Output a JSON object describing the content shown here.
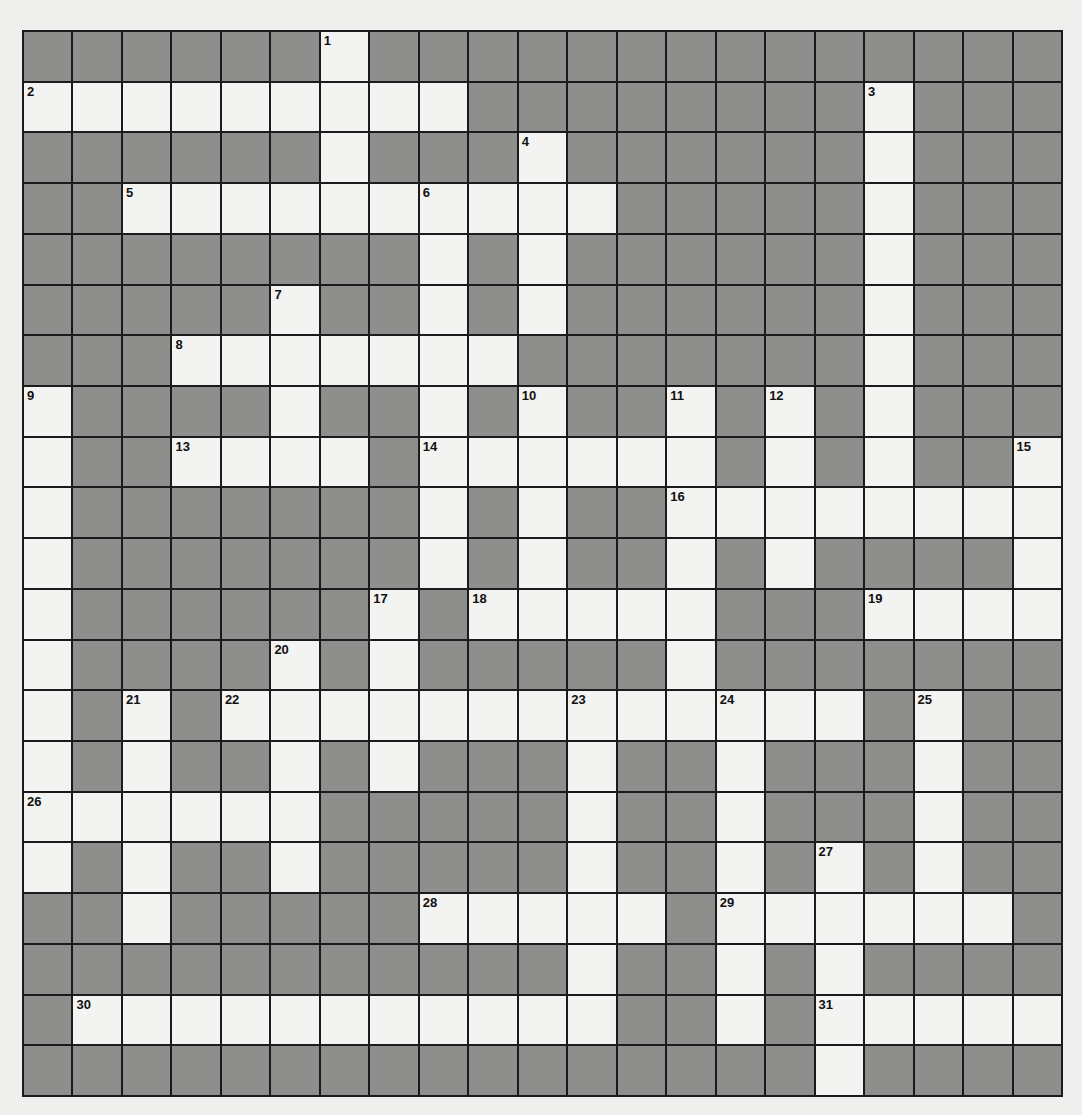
{
  "puzzle": {
    "rows": 21,
    "cols": 21,
    "colors": {
      "white_cell": "#f3f3f1",
      "block_cell": "#8e8e8c",
      "grid_line": "#1b1b1b",
      "page": "#efefed"
    },
    "layout": [
      "######.##############",
      ".........########.###",
      "######.###.######.###",
      "##..........#####.###",
      "########.#.######.###",
      "#####.##.#.######.###",
      "###.......#######.###",
      ".####.##.#.##.#.#.###",
      ".##....#......#.#.##.",
      ".#######.#.##........",
      ".#######.#.##.#.####.",
      ".######.#.....###....",
      ".####.#.#####.#######",
      ".#.#.............#.##",
      ".#.##.#.###.##.###.##",
      "......#####.##.###.##",
      ".#.##.#####.##.#.#.##",
      "##.#####.....#......#",
      "###########.##.#.####",
      "#...........##.#.....",
      "################.####"
    ],
    "numbers": [
      {
        "n": "1",
        "r": 0,
        "c": 6
      },
      {
        "n": "2",
        "r": 1,
        "c": 0
      },
      {
        "n": "3",
        "r": 1,
        "c": 17
      },
      {
        "n": "4",
        "r": 2,
        "c": 10
      },
      {
        "n": "5",
        "r": 3,
        "c": 2
      },
      {
        "n": "6",
        "r": 3,
        "c": 8
      },
      {
        "n": "7",
        "r": 5,
        "c": 5
      },
      {
        "n": "8",
        "r": 6,
        "c": 3
      },
      {
        "n": "9",
        "r": 7,
        "c": 0
      },
      {
        "n": "10",
        "r": 7,
        "c": 10
      },
      {
        "n": "11",
        "r": 7,
        "c": 13
      },
      {
        "n": "12",
        "r": 7,
        "c": 15
      },
      {
        "n": "13",
        "r": 8,
        "c": 3
      },
      {
        "n": "14",
        "r": 8,
        "c": 8
      },
      {
        "n": "15",
        "r": 8,
        "c": 20
      },
      {
        "n": "16",
        "r": 9,
        "c": 13
      },
      {
        "n": "17",
        "r": 11,
        "c": 7
      },
      {
        "n": "18",
        "r": 11,
        "c": 9
      },
      {
        "n": "19",
        "r": 11,
        "c": 17
      },
      {
        "n": "20",
        "r": 12,
        "c": 5
      },
      {
        "n": "21",
        "r": 13,
        "c": 2
      },
      {
        "n": "22",
        "r": 13,
        "c": 4
      },
      {
        "n": "23",
        "r": 13,
        "c": 11
      },
      {
        "n": "24",
        "r": 13,
        "c": 14
      },
      {
        "n": "25",
        "r": 13,
        "c": 18
      },
      {
        "n": "26",
        "r": 15,
        "c": 0
      },
      {
        "n": "27",
        "r": 16,
        "c": 16
      },
      {
        "n": "28",
        "r": 17,
        "c": 8
      },
      {
        "n": "29",
        "r": 17,
        "c": 14
      },
      {
        "n": "30",
        "r": 19,
        "c": 1
      },
      {
        "n": "31",
        "r": 19,
        "c": 16
      }
    ],
    "entries": {
      "across": [
        {
          "n": "2",
          "length": 9
        },
        {
          "n": "5",
          "length": 10
        },
        {
          "n": "8",
          "length": 7
        },
        {
          "n": "13",
          "length": 4
        },
        {
          "n": "14",
          "length": 6
        },
        {
          "n": "16",
          "length": 8
        },
        {
          "n": "18",
          "length": 5
        },
        {
          "n": "19",
          "length": 4
        },
        {
          "n": "22",
          "length": 13
        },
        {
          "n": "26",
          "length": 6
        },
        {
          "n": "28",
          "length": 5
        },
        {
          "n": "29",
          "length": 6
        },
        {
          "n": "30",
          "length": 11
        },
        {
          "n": "31",
          "length": 5
        }
      ],
      "down": [
        {
          "n": "1",
          "length": 4
        },
        {
          "n": "3",
          "length": 9
        },
        {
          "n": "4",
          "length": 4
        },
        {
          "n": "6",
          "length": 8
        },
        {
          "n": "7",
          "length": 4
        },
        {
          "n": "9",
          "length": 10
        },
        {
          "n": "10",
          "length": 5
        },
        {
          "n": "11",
          "length": 7
        },
        {
          "n": "12",
          "length": 4
        },
        {
          "n": "15",
          "length": 4
        },
        {
          "n": "17",
          "length": 4
        },
        {
          "n": "20",
          "length": 5
        },
        {
          "n": "21",
          "length": 5
        },
        {
          "n": "23",
          "length": 7
        },
        {
          "n": "24",
          "length": 7
        },
        {
          "n": "25",
          "length": 4
        },
        {
          "n": "27",
          "length": 5
        }
      ]
    }
  }
}
